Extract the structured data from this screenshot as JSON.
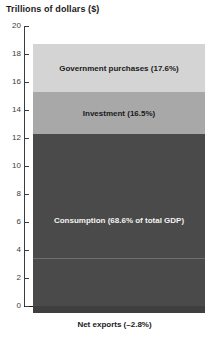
{
  "chart_data": {
    "type": "bar",
    "title": "Trillions of dollars ($)",
    "xlabel": "",
    "ylabel": "Trillions of dollars ($)",
    "ylim": [
      0,
      20
    ],
    "yticks": [
      0,
      2,
      4,
      6,
      8,
      10,
      12,
      14,
      16,
      18,
      20
    ],
    "ytick_labels": [
      "0",
      "2",
      "4",
      "6",
      "8",
      "10",
      "12",
      "14",
      "16",
      "18",
      "20"
    ],
    "grid": false,
    "legend_position": "none",
    "stacked": true,
    "categories": [
      "U.S. GDP components"
    ],
    "series": [
      {
        "name": "Consumption",
        "label": "Consumption (68.6% of total GDP)",
        "percent": 68.6,
        "value_start": 0,
        "value_end": 12.3,
        "value": 12.3,
        "color": "#4a4a4a"
      },
      {
        "name": "Investment",
        "label": "Investment (16.5%)",
        "percent": 16.5,
        "value_start": 12.3,
        "value_end": 15.3,
        "value": 3.0,
        "color": "#a8a8a8"
      },
      {
        "name": "Government purchases",
        "label": "Government purchases (17.6%)",
        "percent": 17.6,
        "value_start": 15.3,
        "value_end": 18.7,
        "value": 3.4,
        "color": "#d4d4d4"
      },
      {
        "name": "Net exports",
        "label": "Net exports (–2.8%)",
        "percent": -2.8,
        "value_start": 0,
        "value_end": -0.5,
        "value": -0.5,
        "color": "#3f3f3f"
      }
    ],
    "annotations": [
      {
        "name": "inner-rule",
        "value": 3.4
      }
    ]
  },
  "colors": {
    "government": "#d4d4d4",
    "investment": "#a8a8a8",
    "consumption": "#4a4a4a",
    "net_exports": "#3f3f3f",
    "axis": "#3c3c3c",
    "baseline": "#1a1a1a",
    "text": "#1a1a1a",
    "text_on_dark": "#f2f2f2",
    "background": "#ffffff"
  }
}
